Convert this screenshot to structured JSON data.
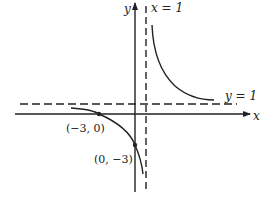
{
  "figure": {
    "function": "y = (x + 3)/(x - 1)",
    "axes": {
      "x_label": "x",
      "y_label": "y"
    },
    "asymptotes": {
      "vertical": {
        "label": "x = 1",
        "value": 1
      },
      "horizontal": {
        "label": "y = 1",
        "value": 1
      }
    },
    "points": [
      {
        "label": "(−3, 0)",
        "x": -3,
        "y": 0
      },
      {
        "label": "(0, −3)",
        "x": 0,
        "y": -3
      }
    ],
    "colors": {
      "ink": "#222222",
      "background": "#ffffff"
    }
  }
}
